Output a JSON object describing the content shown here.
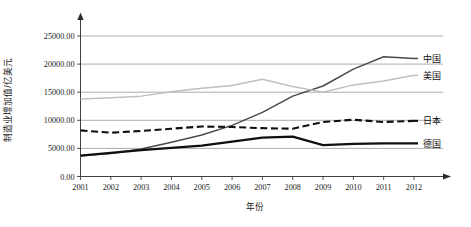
{
  "chart_data": {
    "type": "line",
    "title": "",
    "xlabel": "年份",
    "ylabel": "制造业增加值/亿美元",
    "x": [
      2001,
      2002,
      2003,
      2004,
      2005,
      2006,
      2007,
      2008,
      2009,
      2010,
      2011,
      2012
    ],
    "categories": [
      "2001",
      "2002",
      "2003",
      "2004",
      "2005",
      "2006",
      "2007",
      "2008",
      "2009",
      "2010",
      "2011",
      "2012"
    ],
    "xlim": [
      2001,
      2012
    ],
    "ylim": [
      0,
      25000
    ],
    "yticks": [
      0,
      5000,
      10000,
      15000,
      20000,
      25000
    ],
    "ytick_labels": [
      "0.00",
      "5000.00",
      "10000.00",
      "15000.00",
      "20000.00",
      "25000.00"
    ],
    "grid": true,
    "legend_position": "right-inline",
    "series": [
      {
        "name": "中国",
        "color": "#4a4a4a",
        "style": "solid-thin",
        "values": [
          3700,
          4100,
          4900,
          6100,
          7400,
          9100,
          11400,
          14300,
          16100,
          19100,
          21300,
          21000
        ]
      },
      {
        "name": "美国",
        "color": "#c0c0c0",
        "style": "solid-light",
        "values": [
          13800,
          14000,
          14300,
          15100,
          15700,
          16200,
          17300,
          16000,
          15000,
          16300,
          17000,
          18000
        ]
      },
      {
        "name": "日本",
        "color": "#101010",
        "style": "dashed",
        "values": [
          8200,
          7800,
          8100,
          8500,
          8900,
          8800,
          8600,
          8500,
          9700,
          10100,
          9700,
          9900
        ]
      },
      {
        "name": "德国",
        "color": "#101010",
        "style": "solid-thick",
        "values": [
          3700,
          4200,
          4700,
          5100,
          5500,
          6200,
          6900,
          7100,
          5600,
          5800,
          5900,
          5900
        ]
      }
    ],
    "colors": {
      "china": "#4a4a4a",
      "usa": "#c0c0c0",
      "japan": "#101010",
      "germany": "#101010",
      "gridline": "#8a8a8a",
      "axis": "#2a2a2a",
      "background": "#ffffff"
    }
  }
}
